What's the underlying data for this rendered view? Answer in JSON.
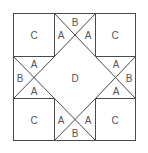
{
  "diagram": {
    "type": "quilt-block",
    "colors": {
      "line": "#4a4a4a",
      "label": "#555555",
      "background": "#ffffff"
    },
    "labels": {
      "corner_top_left": "C",
      "corner_top_right": "C",
      "corner_bottom_left": "C",
      "corner_bottom_right": "C",
      "center": "D",
      "top_unit": {
        "left": "A",
        "top": "B",
        "right": "A"
      },
      "bottom_unit": {
        "left": "A",
        "bottom": "B",
        "right": "A"
      },
      "left_unit": {
        "top": "A",
        "left": "B",
        "bottom": "A"
      },
      "right_unit": {
        "top": "A",
        "right": "B",
        "bottom": "A"
      }
    }
  }
}
